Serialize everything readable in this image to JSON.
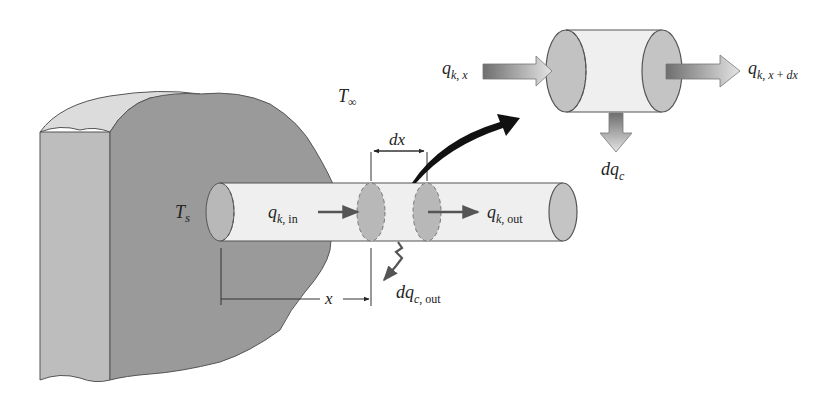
{
  "diagram": {
    "labels": {
      "ambient_temp": {
        "main": "T",
        "sub": "∞"
      },
      "surface_temp": {
        "main": "T",
        "sub": "s"
      },
      "q_in": {
        "main": "q",
        "sub": "k, in"
      },
      "q_out": {
        "main": "q",
        "sub": "k, out"
      },
      "dq_conv_out": {
        "main": "dq",
        "sub": "c, out"
      },
      "dx": "dx",
      "x": "x",
      "q_x": {
        "main": "q",
        "sub": "k, x"
      },
      "q_x_dx": {
        "main": "q",
        "sub": "k, x + dx"
      },
      "dq_c": {
        "main": "dq",
        "sub": "c"
      }
    },
    "colors": {
      "wall_front": "#9a9a9a",
      "wall_side": "#bdbdbd",
      "wall_top": "#dcdcdc",
      "rod_body": "#efefef",
      "rod_end": "#b8b8b8",
      "outline": "#555555",
      "arrow_dark": "#111111",
      "flux_arrow": "#5a5a5a"
    }
  }
}
